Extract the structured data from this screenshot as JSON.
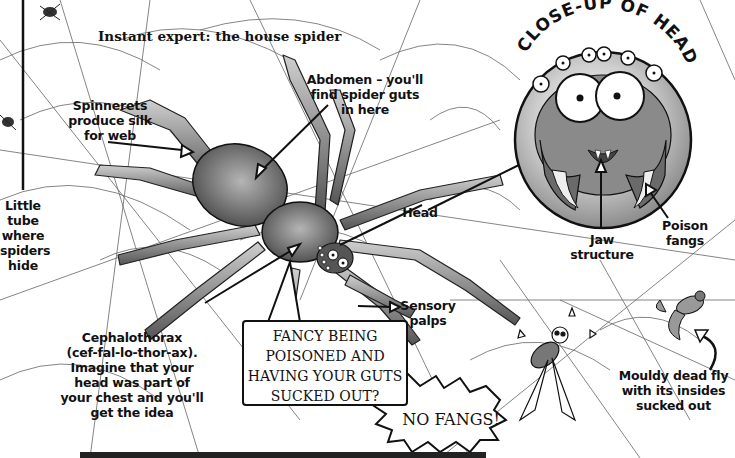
{
  "title": "Instant expert: the house spider",
  "closeup_heading": "CLOSE-UP OF HEAD",
  "labels": {
    "spinnerets": [
      "Spinnerets",
      "produce silk",
      "for web"
    ],
    "abdomen": [
      "Abdomen – you'll",
      "find spider guts",
      "in here"
    ],
    "tube": [
      "Little",
      "tube",
      "where",
      "spiders",
      "hide"
    ],
    "head": [
      "Head"
    ],
    "jaw": [
      "Jaw",
      "structure"
    ],
    "fangs": [
      "Poison",
      "fangs"
    ],
    "palps": [
      "Sensory",
      "palps"
    ],
    "cephalothorax": [
      "Cephalothorax",
      "(cef-fal-lo-thor-ax).",
      "Imagine that your",
      "head was part of",
      "your chest and you'll",
      "get the idea"
    ],
    "fly": [
      "Mouldy dead fly",
      "with its insides",
      "sucked out"
    ]
  },
  "speech_bubble": [
    "FANCY BEING",
    "POISONED AND",
    "HAVING YOUR GUTS",
    "SUCKED OUT?"
  ],
  "exclamation": "NO FANGS!",
  "colors": {
    "ink": "#111111",
    "body_gray": "#6e6e6e",
    "leg_gray": "#8a8a8a",
    "circle_gray": "#9a9a9a",
    "web": "#555555"
  }
}
